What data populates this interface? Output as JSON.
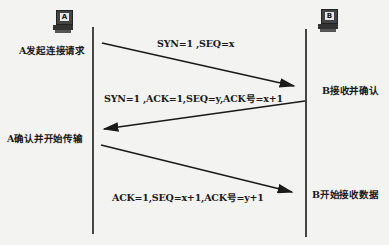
{
  "hosts": {
    "a": {
      "icon_label": "A"
    },
    "b": {
      "icon_label": "B"
    }
  },
  "states": {
    "a_request": "A发起连接请求",
    "b_ack": "B接收并确认",
    "a_confirm": "A确认并开始传输",
    "b_receive": "B开始接收数据"
  },
  "messages": {
    "m1": "SYN=1 ,SEQ=x",
    "m2": "SYN=1 ,ACK=1,SEQ=y,ACK号=x+1",
    "m3": "ACK=1,SEQ=x+1,ACK号=y+1"
  },
  "colors": {
    "line": "#1a1a1a",
    "background": "#f3f3f1"
  }
}
